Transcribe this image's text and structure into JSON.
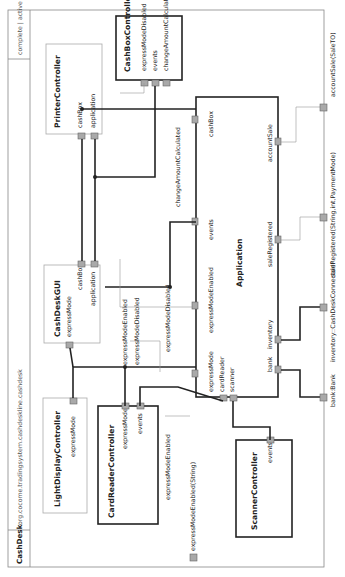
{
  "diagram": {
    "component": "CashDesk",
    "package": "org.cocome.tradingsystem.cashdeskline.cashdesk",
    "status": "complete | active",
    "orientation": "rotated 90deg counter-clockwise"
  },
  "subcomponents": {
    "printer": {
      "name": "PrinterController",
      "ports": [
        "cashBox",
        "application"
      ]
    },
    "cashbox": {
      "name": "CashBoxController",
      "ports": [
        "expressModeDisabled",
        "events",
        "changeAmountCalculated"
      ]
    },
    "gui": {
      "name": "CashDeskGUI",
      "ports": [
        "expressMode",
        "cashBox",
        "application"
      ]
    },
    "light": {
      "name": "LightDisplayController",
      "ports": [
        "expressMode"
      ]
    },
    "cardreader": {
      "name": "CardReaderController",
      "ports": [
        "expressMode",
        "events"
      ]
    },
    "scanner": {
      "name": "ScannerController",
      "ports": [
        "events"
      ]
    },
    "application": {
      "name": "Application",
      "ports_top": [
        "expressMode",
        "expressModeEnabled",
        "events",
        "cashBox"
      ],
      "ports_left": [
        "cardReader",
        "scanner"
      ],
      "ports_bottom": [
        "bank",
        "inventory",
        "saleRegistered",
        "accountSale"
      ]
    }
  },
  "connector_labels": {
    "changeAmountCalculated": "changeAmountCalculated",
    "expressModeEnabled_a": "expressModeEnabled",
    "expressModeDisabled_a": "expressModeDisabled",
    "expressModeDisabled_b": "expressModeDisabled",
    "expressModeEnabled_b": "expressModeEnabled"
  },
  "external_ports": {
    "expressModeEnabledString": "expressModeEnabled(String)",
    "bank": "bank:Bank",
    "inventory": "inventory::CashDeskConnectorIf",
    "saleRegistered": "saleRegistered(String,int,PaymentMode)",
    "accountSale": "accountSale(SaleTO)"
  }
}
